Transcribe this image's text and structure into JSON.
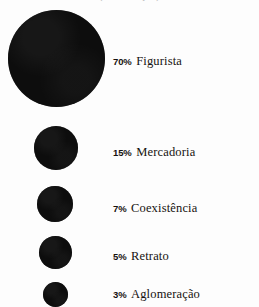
{
  "figure": {
    "title_clipped": "(continuação)",
    "background_color": "#fdfdfd",
    "bubble_color": "#0d0d0d",
    "text_color": "#16120f"
  },
  "chart_data": {
    "type": "bar",
    "title": "",
    "subtitle": "",
    "xlabel": "",
    "ylabel": "",
    "legend_position": "right",
    "grid": false,
    "unit": "%",
    "categories": [
      "Figurista",
      "Mercadoria",
      "Coexistência",
      "Retrato",
      "Aglomeração"
    ],
    "values": [
      70,
      15,
      7,
      5,
      3
    ],
    "value_labels": [
      "70%",
      "15%",
      "7%",
      "5%",
      "3%"
    ],
    "marker_diameters_px": [
      97,
      44,
      36,
      33,
      25
    ]
  },
  "rows": [
    {
      "pct": "70%",
      "name": "Figurista",
      "value": 70,
      "diameter": 97,
      "cx": 56,
      "cy": 58,
      "label_top": 52
    },
    {
      "pct": "15%",
      "name": "Mercadoria",
      "value": 15,
      "diameter": 44,
      "cx": 56,
      "cy": 148,
      "label_top": 143
    },
    {
      "pct": "7%",
      "name": "Coexistência",
      "value": 7,
      "diameter": 36,
      "cx": 55,
      "cy": 204,
      "label_top": 199
    },
    {
      "pct": "5%",
      "name": "Retrato",
      "value": 5,
      "diameter": 33,
      "cx": 55,
      "cy": 252,
      "label_top": 247
    },
    {
      "pct": "3%",
      "name": "Aglomeração",
      "value": 3,
      "diameter": 25,
      "cx": 55,
      "cy": 294,
      "label_top": 285
    }
  ]
}
